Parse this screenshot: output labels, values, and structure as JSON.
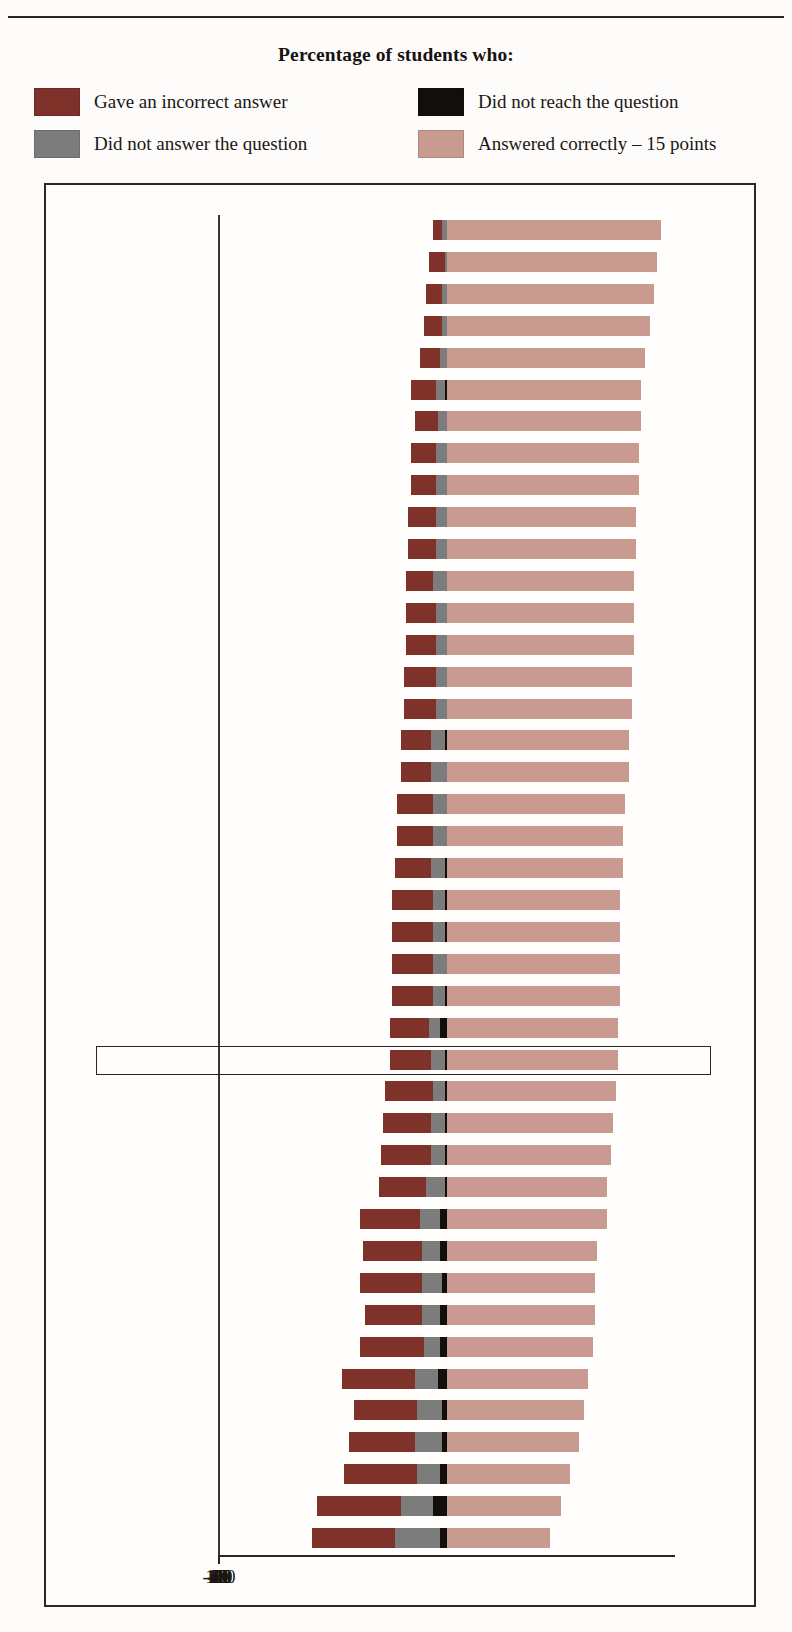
{
  "header": {
    "faint_text": "",
    "legend_title": "Percentage of students who:"
  },
  "legend": {
    "items": [
      {
        "key": "incorrect",
        "label": "Gave an incorrect answer",
        "color": "#7E3229"
      },
      {
        "key": "not_reach",
        "label": "Did not reach the question",
        "color": "#120E0C"
      },
      {
        "key": "no_answer",
        "label": "Did not answer the question",
        "color": "#7C7C7C"
      },
      {
        "key": "correct",
        "label": "Answered correctly – 15 points",
        "color": "#C89A90"
      }
    ]
  },
  "axis": {
    "ticks": [
      "-100",
      "-80",
      "-60",
      "-40",
      "-20",
      "0",
      "20",
      "40",
      "60",
      "80",
      "100"
    ],
    "min": -100,
    "max": 100,
    "step": 20
  },
  "highlight": {
    "row": "OECD average"
  },
  "chart_data": {
    "type": "bar",
    "title": "Percentage of students who:",
    "xlabel": "",
    "ylabel": "",
    "xlim": [
      -100,
      100
    ],
    "grid": true,
    "legend_position": "top",
    "stacked": "diverging",
    "series": [
      {
        "name": "Gave an incorrect answer",
        "key": "incorrect",
        "color": "#7E3229",
        "direction": "negative"
      },
      {
        "name": "Did not answer the question",
        "key": "no_answer",
        "color": "#7C7C7C",
        "direction": "negative"
      },
      {
        "name": "Did not reach the question",
        "key": "not_reach",
        "color": "#120E0C",
        "direction": "negative"
      },
      {
        "name": "Answered correctly – 15 points",
        "key": "correct",
        "color": "#C89A90",
        "direction": "positive"
      }
    ],
    "categories": [
      "Macao-China",
      "Liechtenstein",
      "Hong Kong-China",
      "Korea",
      "Canada",
      "Denmark",
      "Austria",
      "Japan",
      "Australia",
      "Switzerland",
      "Hungary",
      "Belgium",
      "New Zealand",
      "Netherlands",
      "Germany",
      "Slovak Republic",
      "Luxembourg",
      "Finland",
      "Czech Republic",
      "United States",
      "United Kingdom",
      "Portugal",
      "France",
      "Poland",
      "Ireland",
      "Russian Federation",
      "OECD average",
      "Latvia",
      "Spain",
      "Iceland",
      "Italy",
      "Uruguay",
      "Greece",
      "Serbia",
      "Indonesia",
      "Turkey",
      "Tunisia",
      "Sweden",
      "Norway",
      "Thailand",
      "Brazil",
      "Mexico"
    ],
    "rows": [
      {
        "country": "Macao-China",
        "incorrect": 4,
        "no_answer": 2,
        "not_reach": 0,
        "correct": 94,
        "tone": "dark"
      },
      {
        "country": "Liechtenstein",
        "incorrect": 7,
        "no_answer": 1,
        "not_reach": 0,
        "correct": 92,
        "tone": "dark"
      },
      {
        "country": "Hong Kong-China",
        "incorrect": 7,
        "no_answer": 2,
        "not_reach": 0,
        "correct": 91,
        "tone": "dark"
      },
      {
        "country": "Korea",
        "incorrect": 8,
        "no_answer": 2,
        "not_reach": 0,
        "correct": 89,
        "tone": "red"
      },
      {
        "country": "Canada",
        "incorrect": 9,
        "no_answer": 3,
        "not_reach": 0,
        "correct": 87,
        "tone": "red"
      },
      {
        "country": "Denmark",
        "incorrect": 11,
        "no_answer": 4,
        "not_reach": 1,
        "correct": 85,
        "tone": "red"
      },
      {
        "country": "Austria",
        "incorrect": 10,
        "no_answer": 4,
        "not_reach": 0,
        "correct": 85,
        "tone": "red"
      },
      {
        "country": "Japan",
        "incorrect": 11,
        "no_answer": 5,
        "not_reach": 0,
        "correct": 84,
        "tone": "red"
      },
      {
        "country": "Australia",
        "incorrect": 11,
        "no_answer": 5,
        "not_reach": 0,
        "correct": 84,
        "tone": "red"
      },
      {
        "country": "Switzerland",
        "incorrect": 12,
        "no_answer": 5,
        "not_reach": 0,
        "correct": 83,
        "tone": "red"
      },
      {
        "country": "Hungary",
        "incorrect": 12,
        "no_answer": 5,
        "not_reach": 0,
        "correct": 83,
        "tone": "red"
      },
      {
        "country": "Belgium",
        "incorrect": 12,
        "no_answer": 6,
        "not_reach": 0,
        "correct": 82,
        "tone": "red"
      },
      {
        "country": "New Zealand",
        "incorrect": 13,
        "no_answer": 5,
        "not_reach": 0,
        "correct": 82,
        "tone": "dark"
      },
      {
        "country": "Netherlands",
        "incorrect": 13,
        "no_answer": 5,
        "not_reach": 0,
        "correct": 82,
        "tone": "dark"
      },
      {
        "country": "Germany",
        "incorrect": 14,
        "no_answer": 5,
        "not_reach": 0,
        "correct": 81,
        "tone": "red"
      },
      {
        "country": "Slovak Republic",
        "incorrect": 14,
        "no_answer": 5,
        "not_reach": 0,
        "correct": 81,
        "tone": "dark"
      },
      {
        "country": "Luxembourg",
        "incorrect": 13,
        "no_answer": 6,
        "not_reach": 1,
        "correct": 80,
        "tone": "red"
      },
      {
        "country": "Finland",
        "incorrect": 13,
        "no_answer": 7,
        "not_reach": 0,
        "correct": 80,
        "tone": "red"
      },
      {
        "country": "Czech Republic",
        "incorrect": 16,
        "no_answer": 6,
        "not_reach": 0,
        "correct": 78,
        "tone": "dark"
      },
      {
        "country": "United States",
        "incorrect": 16,
        "no_answer": 6,
        "not_reach": 0,
        "correct": 77,
        "tone": "red"
      },
      {
        "country": "United Kingdom",
        "incorrect": 16,
        "no_answer": 6,
        "not_reach": 1,
        "correct": 77,
        "tone": "dark"
      },
      {
        "country": "Portugal",
        "incorrect": 18,
        "no_answer": 5,
        "not_reach": 1,
        "correct": 76,
        "tone": "red"
      },
      {
        "country": "France",
        "incorrect": 18,
        "no_answer": 5,
        "not_reach": 1,
        "correct": 76,
        "tone": "red"
      },
      {
        "country": "Poland",
        "incorrect": 18,
        "no_answer": 6,
        "not_reach": 0,
        "correct": 76,
        "tone": "red"
      },
      {
        "country": "Ireland",
        "incorrect": 18,
        "no_answer": 5,
        "not_reach": 1,
        "correct": 76,
        "tone": "red"
      },
      {
        "country": "Russian Federation",
        "incorrect": 17,
        "no_answer": 5,
        "not_reach": 3,
        "correct": 75,
        "tone": "dark"
      },
      {
        "country": "OECD average",
        "incorrect": 18,
        "no_answer": 6,
        "not_reach": 1,
        "correct": 75,
        "tone": "dark"
      },
      {
        "country": "Latvia",
        "incorrect": 21,
        "no_answer": 5,
        "not_reach": 1,
        "correct": 74,
        "tone": "dark"
      },
      {
        "country": "Spain",
        "incorrect": 21,
        "no_answer": 6,
        "not_reach": 1,
        "correct": 73,
        "tone": "red"
      },
      {
        "country": "Iceland",
        "incorrect": 22,
        "no_answer": 6,
        "not_reach": 1,
        "correct": 72,
        "tone": "red"
      },
      {
        "country": "Italy",
        "incorrect": 21,
        "no_answer": 8,
        "not_reach": 1,
        "correct": 70,
        "tone": "dark"
      },
      {
        "country": "Uruguay",
        "incorrect": 26,
        "no_answer": 9,
        "not_reach": 3,
        "correct": 70,
        "tone": "dark"
      },
      {
        "country": "Greece",
        "incorrect": 26,
        "no_answer": 8,
        "not_reach": 3,
        "correct": 66,
        "tone": "red"
      },
      {
        "country": "Serbia",
        "incorrect": 27,
        "no_answer": 9,
        "not_reach": 2,
        "correct": 65,
        "tone": "dark"
      },
      {
        "country": "Indonesia",
        "incorrect": 25,
        "no_answer": 8,
        "not_reach": 3,
        "correct": 65,
        "tone": "dark"
      },
      {
        "country": "Turkey",
        "incorrect": 28,
        "no_answer": 7,
        "not_reach": 3,
        "correct": 64,
        "tone": "red"
      },
      {
        "country": "Tunisia",
        "incorrect": 32,
        "no_answer": 10,
        "not_reach": 4,
        "correct": 62,
        "tone": "dark"
      },
      {
        "country": "Sweden",
        "incorrect": 28,
        "no_answer": 11,
        "not_reach": 2,
        "correct": 60,
        "tone": "red"
      },
      {
        "country": "Norway",
        "incorrect": 29,
        "no_answer": 12,
        "not_reach": 2,
        "correct": 58,
        "tone": "red"
      },
      {
        "country": "Thailand",
        "incorrect": 32,
        "no_answer": 10,
        "not_reach": 3,
        "correct": 54,
        "tone": "dark"
      },
      {
        "country": "Brazil",
        "incorrect": 37,
        "no_answer": 14,
        "not_reach": 6,
        "correct": 50,
        "tone": "dark"
      },
      {
        "country": "Mexico",
        "incorrect": 36,
        "no_answer": 20,
        "not_reach": 3,
        "correct": 45,
        "tone": "red"
      }
    ]
  }
}
